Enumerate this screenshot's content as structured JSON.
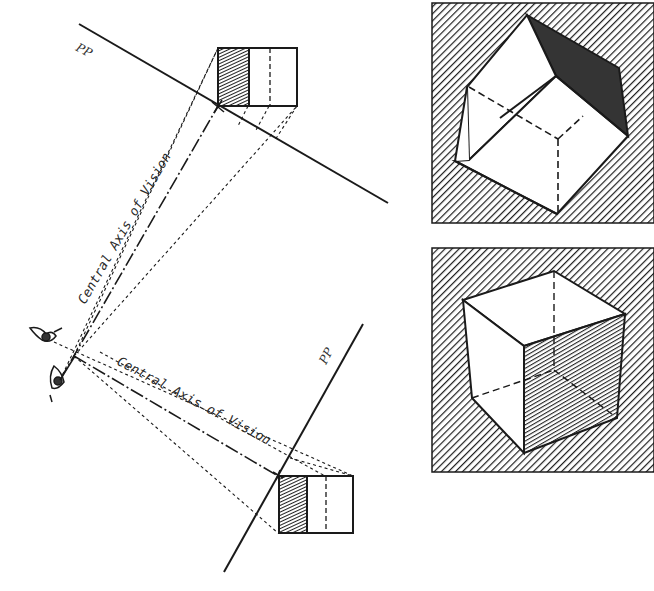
{
  "diagram": {
    "type": "perspective-illustration",
    "left_panel": {
      "picture_planes": [
        {
          "label": "PP",
          "position": "upper"
        },
        {
          "label": "PP",
          "position": "lower"
        }
      ],
      "axis_labels": [
        {
          "text": "Central Axis of Vision",
          "orientation": "toward-upper-picture-plane"
        },
        {
          "text": "Central Axis of Vision",
          "orientation": "toward-lower-picture-plane"
        }
      ],
      "observer": {
        "icon": "eye-icon",
        "count": 2
      },
      "plan_views": [
        {
          "position": "upper",
          "shaded_face": "left",
          "hidden_edge": "dashed-vertical"
        },
        {
          "position": "lower",
          "shaded_face": "left",
          "hidden_edge": "dashed-vertical"
        }
      ]
    },
    "right_panel": {
      "views": [
        {
          "position": "top",
          "description": "cube viewed from below with dark shaded top-right face",
          "background": "diagonal-hatch"
        },
        {
          "position": "bottom",
          "description": "cube viewed from above with hatched right face",
          "background": "diagonal-hatch"
        }
      ]
    },
    "colors": {
      "ink": "#1a1a1a",
      "paper": "#ffffff",
      "shade_dark": "#2b2b2b"
    }
  }
}
